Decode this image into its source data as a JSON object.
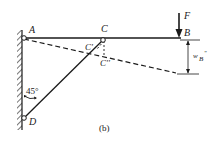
{
  "figure": {
    "caption": "(b)",
    "labels": {
      "A": "A",
      "B": "B",
      "C": "C",
      "C_prime": "C'",
      "C_double_prime": "C''",
      "D": "D",
      "F": "F",
      "angle": "45°",
      "deflection_w": "w",
      "deflection_sub": "B",
      "deflection_sup": "\""
    },
    "colors": {
      "line": "#1a1a1a",
      "background": "#ffffff"
    }
  }
}
